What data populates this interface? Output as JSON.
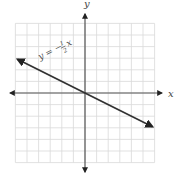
{
  "chart_data": {
    "type": "line",
    "title": "",
    "xlabel": "x",
    "ylabel": "y",
    "xlim": [
      -6,
      6
    ],
    "ylim": [
      -6,
      6
    ],
    "grid": true,
    "grid_step": 1,
    "series": [
      {
        "name": "y = -1/2 x",
        "equation": "y = -(1/2)x",
        "slope": -0.5,
        "intercept": 0,
        "x": [
          -6,
          6
        ],
        "y": [
          3,
          -3
        ]
      }
    ],
    "annotations": [
      {
        "text": "y = −",
        "fraction_numerator": "1",
        "fraction_denominator": "2",
        "suffix": "x"
      }
    ]
  },
  "labels": {
    "x_axis": "x",
    "y_axis": "y",
    "eq_prefix": "y = −",
    "eq_num": "1",
    "eq_den": "2",
    "eq_suffix": "x"
  }
}
